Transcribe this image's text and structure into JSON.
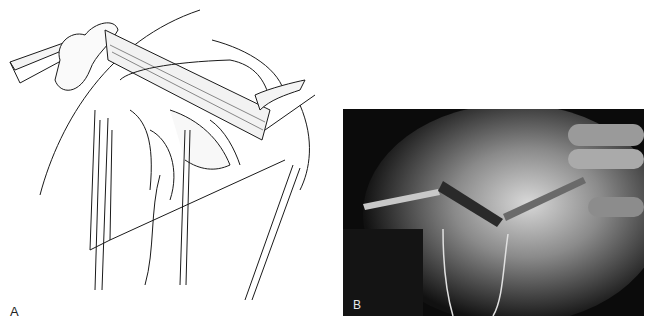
{
  "figure": {
    "panels": [
      {
        "id": "A",
        "label": "A",
        "type": "line-illustration",
        "description": "Surgical line drawing: muscle flap retracted by instrument, exposed vessels and nerves with vessel loops, wound edges"
      },
      {
        "id": "B",
        "label": "B",
        "type": "grayscale-photograph",
        "description": "Intraoperative photograph of the corresponding exposure with retractor and gloved hand"
      }
    ],
    "colors": {
      "background": "#ffffff",
      "ink": "#1a1a1a",
      "photo_dark": "#0b0b0b",
      "photo_light": "#d8d8d8"
    }
  }
}
